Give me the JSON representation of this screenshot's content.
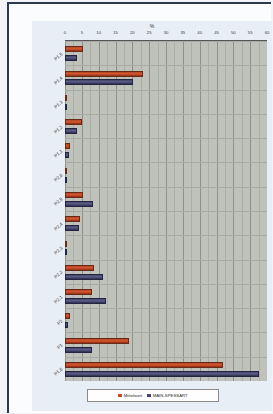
{
  "chart_data": {
    "type": "bar",
    "orientation": "horizontal",
    "title": "",
    "xlabel": "%",
    "ylabel": "",
    "xlim": [
      0,
      60
    ],
    "grid": true,
    "legend_position": "bottom",
    "xticks": [
      "0",
      "5",
      "10",
      "15",
      "20",
      "25",
      "30",
      "35",
      "40",
      "45",
      "50",
      "55",
      "60"
    ],
    "categories": [
      "P1,5",
      "P1,4",
      "P1,3",
      "P1,2",
      "P1,1",
      "P2,6",
      "P2,5",
      "P2,4",
      "P2,3",
      "P2,2",
      "P2,1",
      "P2",
      "P1",
      "P1,6"
    ],
    "series": [
      {
        "name": "Mittelwert",
        "color": "#c24a26",
        "values": [
          5.4,
          23.2,
          0.4,
          5.0,
          1.4,
          0.7,
          5.3,
          4.6,
          0.4,
          8.6,
          8.0,
          1.5,
          18.9,
          47.0
        ]
      },
      {
        "name": "MAIN-SPESSART",
        "color": "#44466c",
        "values": [
          3.6,
          20.3,
          0.2,
          3.6,
          1.2,
          0.2,
          8.4,
          4.3,
          0.0,
          11.2,
          12.2,
          0.9,
          7.9,
          57.5
        ]
      }
    ]
  },
  "axis": {
    "percent_symbol": "%"
  },
  "legend": {
    "items": [
      {
        "label": "Mittelwert",
        "color": "#c24a26"
      },
      {
        "label": "MAIN-SPESSART",
        "color": "#44466c"
      }
    ]
  }
}
